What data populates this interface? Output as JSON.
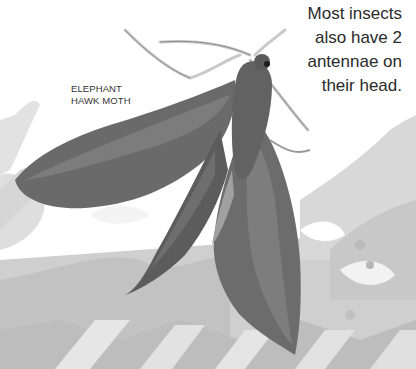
{
  "caption": {
    "lines": [
      "Most insects",
      "also have 2",
      "antennae on",
      "their head."
    ]
  },
  "specimen_label": {
    "lines": [
      "ELEPHANT",
      "HAWK MOTH"
    ]
  },
  "illustration": {
    "subject": "moth-photo",
    "palette": {
      "background": "#ffffff",
      "splash_light": "#dcdcdc",
      "splash_mid": "#c4c4c4",
      "splash_dark": "#a8a8a8",
      "wing_dark": "#5e5e5e",
      "wing_mid": "#7a7a7a",
      "wing_light": "#9a9a9a",
      "body": "#6a6a6a",
      "antenna": "#cfcfcf"
    }
  }
}
